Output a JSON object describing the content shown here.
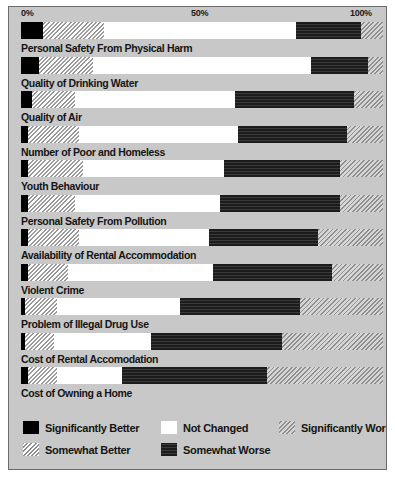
{
  "chart_data": {
    "type": "bar",
    "title": "",
    "subtitle": "",
    "xlabel": "",
    "ylabel": "",
    "orientation": "horizontal",
    "stacked": true,
    "units": "percent",
    "xlim": [
      0,
      100
    ],
    "grid": false,
    "legend_position": "bottom",
    "axis_ticks": [
      "0%",
      "50%",
      "100%"
    ],
    "axis_tick_values": [
      0,
      50,
      100
    ],
    "series": [
      {
        "name": "Significantly Better",
        "key": "sig-better",
        "swatch": "black"
      },
      {
        "name": "Somewhat  Better",
        "key": "som-better",
        "swatch": "light-diagonal-hatch"
      },
      {
        "name": "Not Changed",
        "key": "not-changed",
        "swatch": "white"
      },
      {
        "name": "Somewhat Worse",
        "key": "som-worse",
        "swatch": "dark-solid"
      },
      {
        "name": "Significantly Worse",
        "key": "sig-worse",
        "swatch": "grey-diagonal-hatch"
      }
    ],
    "categories": [
      "Personal Safety From Physical Harm",
      "Quality of Drinking Water",
      "Quality of Air",
      "Number of Poor and Homeless",
      "Youth Behaviour",
      "Personal Safety From Pollution",
      "Availability of Rental Accommodation",
      "Violent Crime",
      "Problem of Illegal Drug Use",
      "Cost of Rental Accomodation",
      "Cost of Owning a Home"
    ],
    "rows": [
      {
        "label": "Personal Safety From Physical Harm",
        "values": [
          6,
          17,
          53,
          18,
          6
        ]
      },
      {
        "label": "Quality of Drinking Water",
        "values": [
          5,
          15,
          60,
          16,
          4
        ]
      },
      {
        "label": "Quality of Air",
        "values": [
          3,
          12,
          44,
          33,
          8
        ]
      },
      {
        "label": "Number of Poor and Homeless",
        "values": [
          2,
          14,
          44,
          30,
          10
        ]
      },
      {
        "label": "Youth Behaviour",
        "values": [
          2,
          15,
          39,
          32,
          12
        ]
      },
      {
        "label": "Personal Safety From Pollution",
        "values": [
          2,
          13,
          40,
          33,
          12
        ]
      },
      {
        "label": "Availability of Rental Accommodation",
        "values": [
          2,
          14,
          36,
          30,
          18
        ]
      },
      {
        "label": "Violent Crime",
        "values": [
          2,
          11,
          40,
          33,
          14
        ]
      },
      {
        "label": "Problem of Illegal Drug Use",
        "values": [
          1,
          9,
          34,
          33,
          23
        ]
      },
      {
        "label": "Cost of Rental Accomodation",
        "values": [
          1,
          8,
          27,
          36,
          28
        ]
      },
      {
        "label": "Cost of Owning a Home",
        "values": [
          2,
          8,
          18,
          40,
          32
        ]
      }
    ]
  },
  "axis": {
    "tick_0": "0%",
    "tick_50": "50%",
    "tick_100": "100%"
  },
  "legend": {
    "items": [
      {
        "label": "Significantly Better",
        "key": "sig-better"
      },
      {
        "label": "Not Changed",
        "key": "not-changed"
      },
      {
        "label": "Significantly Worse",
        "key": "sig-worse"
      },
      {
        "label": "Somewhat  Better",
        "key": "som-better"
      },
      {
        "label": "Somewhat Worse",
        "key": "som-worse"
      }
    ]
  },
  "colors": {
    "frame_background": "#c8c8c8",
    "frame_border": "#6b6b6b",
    "significantly_better": "#000000",
    "not_changed": "#ffffff",
    "somewhat_worse": "#262626",
    "hatch_line": "#8f8f8f",
    "text": "#151515"
  }
}
